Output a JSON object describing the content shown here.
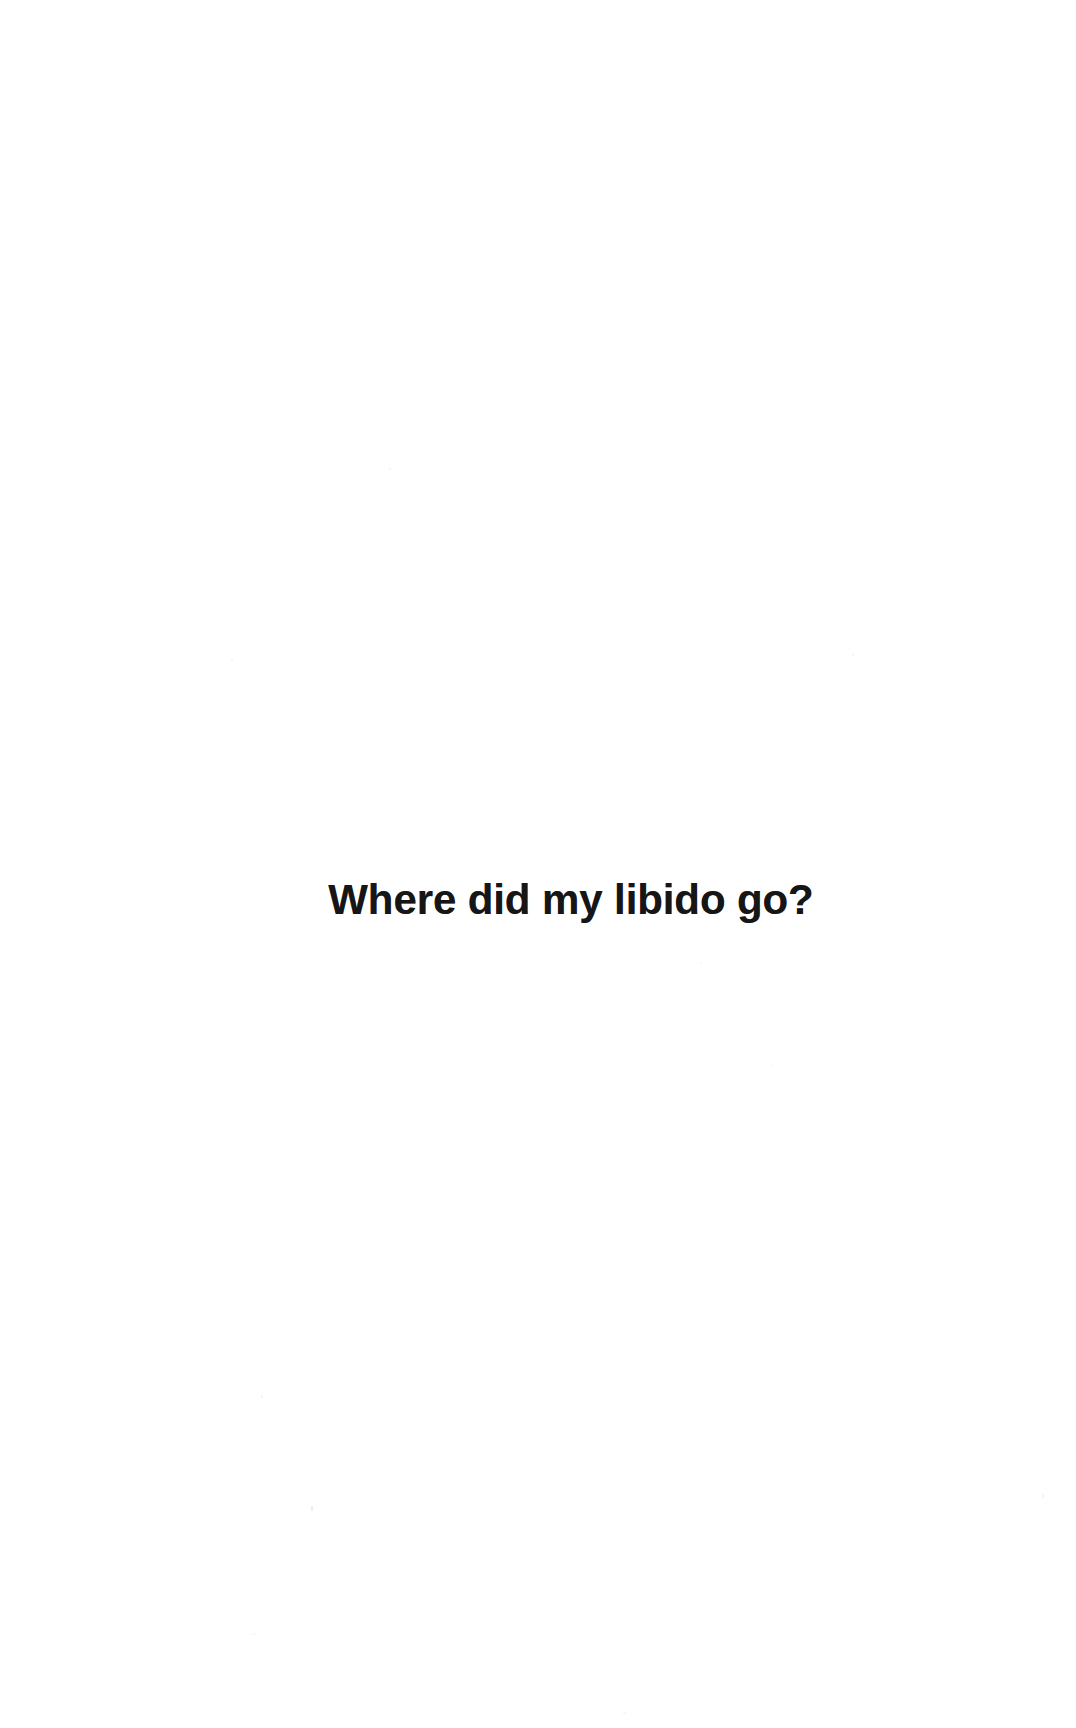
{
  "document": {
    "type": "scanned-book-page",
    "page_background": "#ffffff",
    "text_color": "#161616"
  },
  "page": {
    "heading": "Where did my libido go?"
  }
}
